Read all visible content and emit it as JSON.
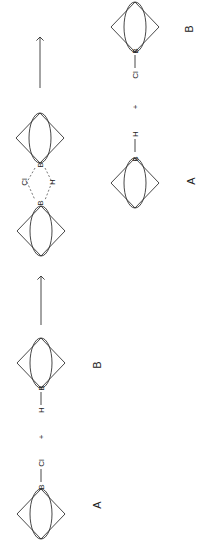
{
  "diagram": {
    "orientation": "rotated 90deg counter-clockwise",
    "reactants": {
      "cage_a_label": "A",
      "cage_b_label": "B",
      "atom_a_boron": "B",
      "atom_a_sub": "Cl",
      "atom_b_boron": "B",
      "atom_b_sub": "H",
      "plus": "+"
    },
    "transition_state": {
      "boron_left": "B",
      "boron_right": "B",
      "bridge_top": "Cl",
      "bridge_bottom": "H"
    },
    "products": {
      "cage_a_label": "A",
      "cage_b_label": "B",
      "atom_a_boron": "B",
      "atom_a_sub": "H",
      "atom_b_boron": "B",
      "atom_b_sub": "Cl",
      "plus": "+"
    },
    "arrows": [
      "reaction-arrow-1",
      "reaction-arrow-2"
    ]
  }
}
